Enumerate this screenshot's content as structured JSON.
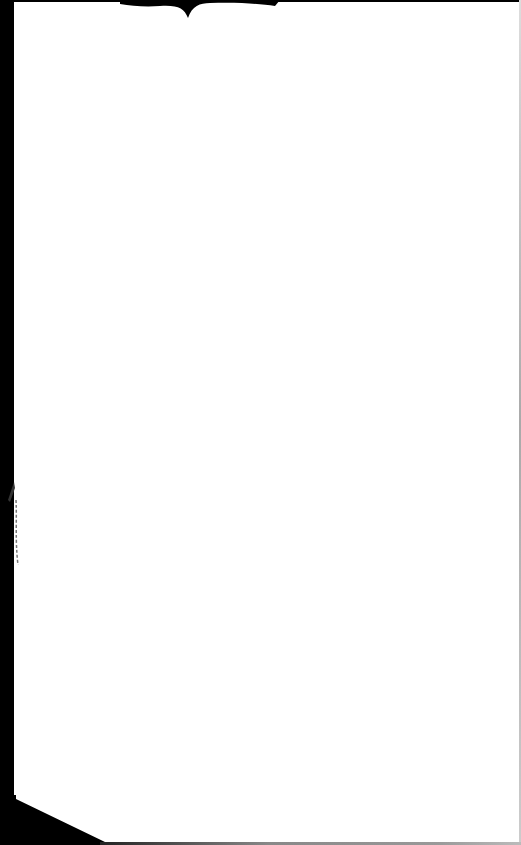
{
  "page": {
    "type": "scanned-blank-page",
    "content_text": "",
    "colors": {
      "paper": "#ffffff",
      "scan_border": "#000000"
    }
  }
}
